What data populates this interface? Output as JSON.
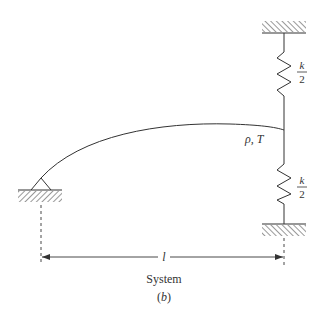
{
  "figure": {
    "caption": "System",
    "sublabel": "(b)",
    "string_label": "ρ, T",
    "length_label": "l",
    "upper_spring": {
      "numerator": "k",
      "denominator": "2"
    },
    "lower_spring": {
      "numerator": "k",
      "denominator": "2"
    },
    "colors": {
      "line": "#333333",
      "background": "#ffffff"
    }
  }
}
